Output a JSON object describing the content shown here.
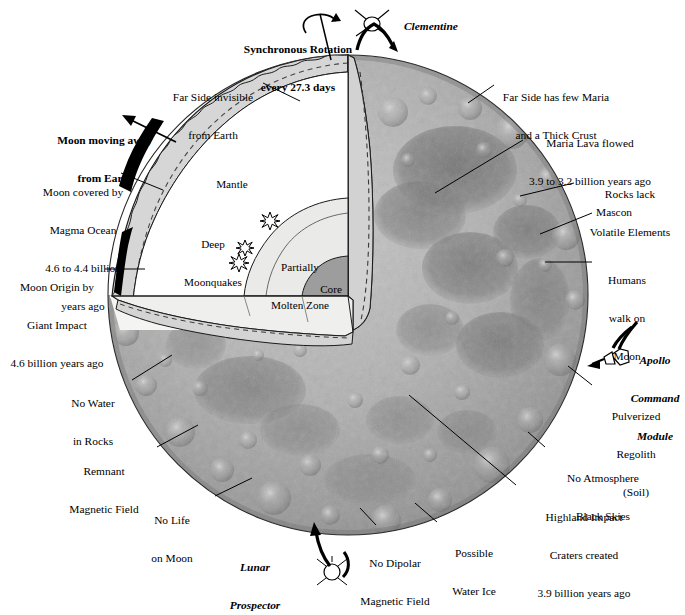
{
  "figure": {
    "type": "annotated-diagram"
  },
  "colors": {
    "background": "#ffffff",
    "ink": "#000000",
    "crust_fill": "#d2d2d2",
    "crust_fill_light": "#e2e2e2",
    "magma_black": "#000000",
    "mantle_fill": "#ffffff",
    "molten_fill": "#e8e8e6",
    "core_fill": "#9c9c9c",
    "cut_plane": "#f2f2f0",
    "moon_light": "#b9b9b9",
    "moon_mid": "#9a9a9a",
    "maria_dark": "#6f6f6f"
  },
  "top": {
    "rotation": "Synchronous Rotation\never y 27.3 days",
    "rotation_line1": "Synchronous Rotation",
    "rotation_line2": "every 27.3 days",
    "clementine": "Clementine"
  },
  "interior": {
    "mantle": "Mantle",
    "deep_moonquakes_line1": "Deep",
    "deep_moonquakes_line2": "Moonquakes",
    "partially_molten_line1": "Partially",
    "partially_molten_line2": "Molten Zone",
    "core": "Core"
  },
  "labels_left": [
    {
      "name": "far-side-invisible",
      "lines": [
        "Far Side invisible",
        "from Earth"
      ]
    },
    {
      "name": "moon-moving-away",
      "lines": [
        "Moon moving away",
        "from Earth"
      ],
      "style": "bold"
    },
    {
      "name": "magma-ocean",
      "lines": [
        "Moon covered by",
        "Magma Ocean",
        "4.6 to 4.4 billion",
        "years ago"
      ]
    },
    {
      "name": "giant-impact-origin",
      "lines": [
        "Moon Origin by",
        "Giant Impact",
        "4.6 billion years ago"
      ]
    },
    {
      "name": "no-water-in-rocks",
      "lines": [
        "No Water",
        "in Rocks"
      ]
    },
    {
      "name": "remnant-magnetic-field",
      "lines": [
        "Remnant",
        "Magnetic Field"
      ]
    },
    {
      "name": "no-life-on-moon",
      "lines": [
        "No Life",
        "on Moon"
      ]
    }
  ],
  "labels_right": [
    {
      "name": "far-side-thick-crust",
      "lines": [
        "Far Side has few Maria",
        "and a Thick Crust"
      ]
    },
    {
      "name": "maria-lava",
      "lines": [
        "Maria Lava flowed",
        "3.9 to 3.2 billion years ago"
      ]
    },
    {
      "name": "rocks-lack-volatiles",
      "lines": [
        "Rocks lack",
        "Volatile Elements"
      ]
    },
    {
      "name": "mascon",
      "lines": [
        "Mascon"
      ]
    },
    {
      "name": "humans-walk-on-moon",
      "lines": [
        "Humans",
        "walk on",
        "Moon"
      ]
    },
    {
      "name": "pulverized-regolith",
      "lines": [
        "Pulverized",
        "Regolith",
        "(Soil)"
      ]
    },
    {
      "name": "no-atmosphere",
      "lines": [
        "No Atmosphere",
        "Black Skies"
      ]
    },
    {
      "name": "highland-craters",
      "lines": [
        "Highland Impact",
        "Craters created",
        "3.9 billion years ago"
      ]
    }
  ],
  "labels_bottom": [
    {
      "name": "possible-water-ice",
      "lines": [
        "Possible",
        "Water Ice"
      ]
    },
    {
      "name": "no-dipolar-field",
      "lines": [
        "No Dipolar",
        "Magnetic Field"
      ]
    }
  ],
  "spacecraft": [
    {
      "name": "clementine",
      "label": "Clementine",
      "style": "bold-italic"
    },
    {
      "name": "apollo-command-module",
      "lines": [
        "Apollo",
        "Command",
        "Module"
      ],
      "style": "bold-italic"
    },
    {
      "name": "lunar-prospector",
      "lines": [
        "Lunar",
        "Prospector"
      ],
      "style": "bold-italic"
    }
  ]
}
